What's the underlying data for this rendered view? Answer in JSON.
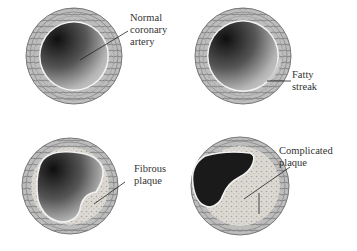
{
  "figure": {
    "panels": [
      {
        "id": "normal",
        "label_lines": [
          "Normal",
          "coronary",
          "artery"
        ]
      },
      {
        "id": "fatty",
        "label_lines": [
          "Fatty",
          "streak"
        ]
      },
      {
        "id": "fibrous",
        "label_lines": [
          "Fibrous",
          "plaque"
        ]
      },
      {
        "id": "complicated",
        "label_lines": [
          "Complicated",
          "plaque"
        ]
      }
    ]
  },
  "colors": {
    "wall": "#8a8a8a",
    "lumen_dark": "#1a1a1a",
    "lumen_light": "#c8c8c8",
    "plaque": "#d9d6d0",
    "background": "#ffffff"
  }
}
